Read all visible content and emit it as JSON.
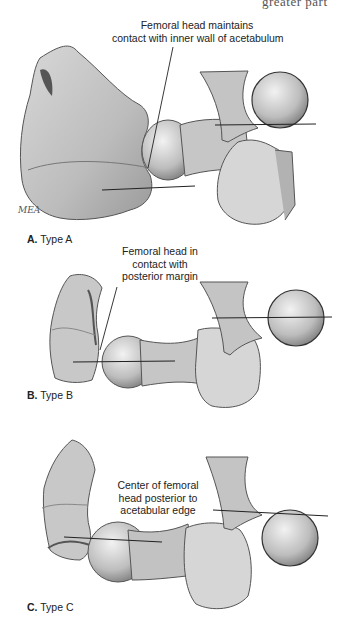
{
  "page_header_fragment": "greater part",
  "figure": {
    "panels": [
      {
        "id": "A",
        "label_letter": "A.",
        "label_text": "Type A",
        "annotation_lines": [
          "Femoral head maintains",
          "contact with inner wall of acetabulum"
        ],
        "inset": "femoral head sphere resting against acetabular wall, tangent line below"
      },
      {
        "id": "B",
        "label_letter": "B.",
        "label_text": "Type B",
        "annotation_lines": [
          "Femoral head in",
          "contact with",
          "posterior margin"
        ],
        "inset": "femoral head sphere with horizontal line through center at acetabular edge"
      },
      {
        "id": "C",
        "label_letter": "C.",
        "label_text": "Type C",
        "annotation_lines": [
          "Center of femoral",
          "head posterior to",
          "acetabular edge"
        ],
        "inset": "femoral head sphere below line extended from acetabular edge"
      }
    ],
    "artist_signature": "MEA"
  },
  "colors": {
    "background": "#ffffff",
    "bone_light": "#e6e6e6",
    "bone_mid": "#b8b8b8",
    "bone_dark": "#7a7a7a",
    "outline": "#333333",
    "text": "#222222"
  }
}
